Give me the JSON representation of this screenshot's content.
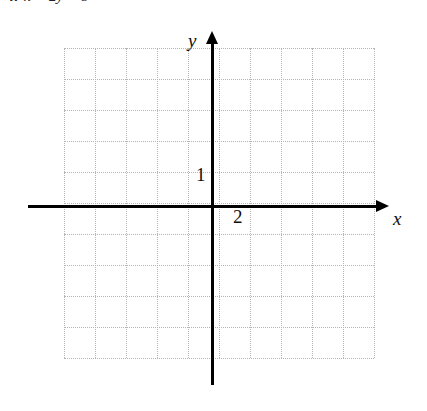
{
  "figure": {
    "kind": "cartesian-coordinate-grid",
    "width": 427,
    "height": 411,
    "background_color": "#ffffff"
  },
  "problem": {
    "number": "4.",
    "lhs_var_1": "x",
    "operator_minus": "−",
    "coefficient": "2",
    "lhs_var_2": "y",
    "equals": "=",
    "rhs": "8"
  },
  "axes": {
    "x_label": "x",
    "y_label": "y",
    "x_axis_color": "#000000",
    "y_axis_color": "#000000",
    "origin_x_px": 212,
    "origin_y_px": 207,
    "x_arrow_direction": "right",
    "y_arrow_direction": "up"
  },
  "tick_labels": [
    {
      "text": "1",
      "axis": "y",
      "value": 1
    },
    {
      "text": "2",
      "axis": "x",
      "value": 2
    }
  ],
  "grid": {
    "dot_color": "#b4b4b4",
    "style": "dotted",
    "spacing_px": 31,
    "columns": 10,
    "rows": 10,
    "left_px": 64,
    "top_px": 48,
    "width_px": 310,
    "height_px": 310,
    "vertical_positions": [
      0,
      31,
      62,
      93,
      124,
      155,
      186,
      217,
      248,
      279,
      310
    ],
    "horizontal_positions": [
      0,
      31,
      62,
      93,
      124,
      155,
      186,
      217,
      248,
      279,
      310
    ]
  },
  "chart_data": {
    "type": "scatter",
    "title": "",
    "xlabel": "x",
    "ylabel": "y",
    "xlim": [
      -5,
      5
    ],
    "ylim": [
      -5,
      5
    ],
    "grid": true,
    "legend": "none",
    "series": [],
    "x": [],
    "values": [],
    "annotations": [
      {
        "text": "1",
        "x": 0,
        "y": 1,
        "placement": "left-of-y-axis"
      },
      {
        "text": "2",
        "x": 1,
        "y": 0,
        "placement": "below-x-axis"
      }
    ]
  }
}
